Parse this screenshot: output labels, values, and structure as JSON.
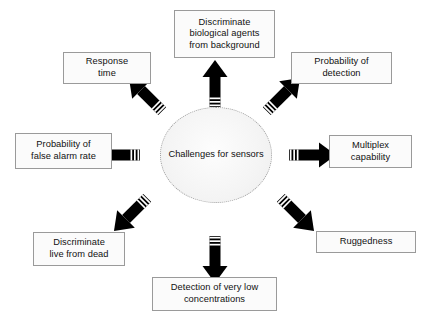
{
  "diagram": {
    "type": "radial-hub-and-spoke",
    "background_color": "#ffffff",
    "arrow_color": "#000000",
    "box_border_color": "#9a9a9a",
    "box_fill_color": "#fbfbfb",
    "hub_border_style": "dotted",
    "hub": {
      "label_line1": "Challenges for",
      "label_line2": "sensors"
    },
    "nodes": [
      {
        "id": "discriminate-biological-agents",
        "direction": "north",
        "lines": [
          "Discriminate",
          "biological agents",
          "from background"
        ]
      },
      {
        "id": "response-time",
        "direction": "northwest",
        "lines": [
          "Response",
          "time"
        ]
      },
      {
        "id": "probability-of-detection",
        "direction": "northeast",
        "lines": [
          "Probability of",
          "detection"
        ]
      },
      {
        "id": "probability-of-false-alarm-rate",
        "direction": "west",
        "lines": [
          "Probability of",
          "false alarm rate"
        ]
      },
      {
        "id": "multiplex-capability",
        "direction": "east",
        "lines": [
          "Multiplex",
          "capability"
        ]
      },
      {
        "id": "discriminate-live-from-dead",
        "direction": "southwest",
        "lines": [
          "Discriminate",
          "live from dead"
        ]
      },
      {
        "id": "ruggedness",
        "direction": "southeast",
        "lines": [
          "Ruggedness"
        ]
      },
      {
        "id": "detection-of-very-low-concentrations",
        "direction": "south",
        "lines": [
          "Detection of very low",
          "concentrations"
        ]
      }
    ]
  }
}
